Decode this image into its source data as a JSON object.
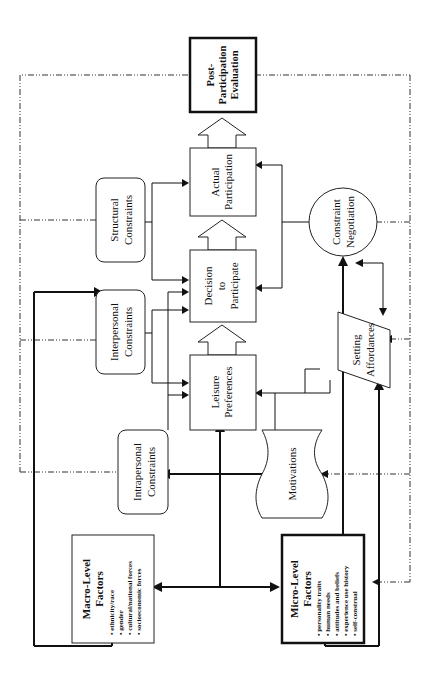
{
  "diagram": {
    "orientation": "rotated 90 degrees counter-clockwise",
    "nodes": {
      "macro": {
        "title_line1": "Macro-Level",
        "title_line2": "Factors",
        "bullets": [
          "• ethnicity/race",
          "• gender",
          "• cultural/national forces",
          "• socioeconomic forces"
        ]
      },
      "micro": {
        "title_line1": "Micro-Level",
        "title_line2": "Factors",
        "bullets": [
          "• personality traits",
          "• human needs",
          "• attitudes and beliefs",
          "• experience use history",
          "• self-construal"
        ]
      },
      "intrapersonal": {
        "line1": "Intrapersonal",
        "line2": "Constraints"
      },
      "interpersonal": {
        "line1": "Interpersonal",
        "line2": "Constraints"
      },
      "structural": {
        "line1": "Structural",
        "line2": "Constraints"
      },
      "motivations": {
        "label": "Motivations"
      },
      "leisure": {
        "line1": "Leisure",
        "line2": "Preferences"
      },
      "decision": {
        "line1": "Decision",
        "line2": "to",
        "line3": "Participate"
      },
      "actual": {
        "line1": "Actual",
        "line2": "Participation"
      },
      "post": {
        "line1": "Post-",
        "line2": "Participation",
        "line3": "Evaluation"
      },
      "negotiation": {
        "line1": "Constraint",
        "line2": "Negotiation"
      },
      "affordances": {
        "line1": "Setting",
        "line2": "Affordances"
      }
    },
    "flow": [
      "Leisure Preferences",
      "Decision to Participate",
      "Actual Participation",
      "Post-Participation Evaluation"
    ],
    "feedback": "dash-dot lines from Post-Participation Evaluation back to constraints, motivations, negotiation, affordances and factor boxes"
  }
}
